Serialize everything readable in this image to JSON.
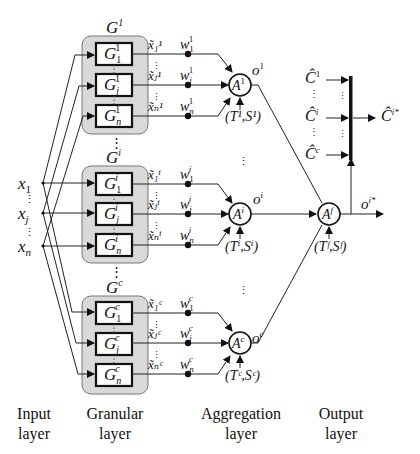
{
  "diagram": {
    "type": "granular neural network architecture",
    "inputs": [
      {
        "symbol": "x",
        "sub": "1"
      },
      {
        "symbol": "x",
        "sub": "j"
      },
      {
        "symbol": "x",
        "sub": "n"
      }
    ],
    "groups": [
      {
        "id": "1",
        "title": "G",
        "title_sup": "1",
        "granules": [
          {
            "sub": "1",
            "sup": "1"
          },
          {
            "sub": "j",
            "sup": "1"
          },
          {
            "sub": "n",
            "sup": "1"
          }
        ],
        "outputs": [
          "x̃₁¹",
          "x̃ⱼ¹",
          "x̃ₙ¹"
        ],
        "weights": [
          {
            "sub": "1",
            "sup": "1"
          },
          {
            "sub": "j",
            "sup": "1"
          },
          {
            "sub": "n",
            "sup": "1"
          }
        ],
        "aggregator": {
          "symbol": "A",
          "sup": "1"
        },
        "params": "(T¹,S¹)",
        "output": {
          "symbol": "o",
          "sup": "1"
        }
      },
      {
        "id": "i",
        "title": "G",
        "title_sup": "i",
        "granules": [
          {
            "sub": "1",
            "sup": "i"
          },
          {
            "sub": "j",
            "sup": "i"
          },
          {
            "sub": "n",
            "sup": "i"
          }
        ],
        "outputs": [
          "x̃₁ⁱ",
          "x̃ⱼⁱ",
          "x̃ₙⁱ"
        ],
        "weights": [
          {
            "sub": "1",
            "sup": "i"
          },
          {
            "sub": "j",
            "sup": "i"
          },
          {
            "sub": "n",
            "sup": "i"
          }
        ],
        "aggregator": {
          "symbol": "A",
          "sup": "i"
        },
        "params": "(Tⁱ,Sⁱ)",
        "output": {
          "symbol": "o",
          "sup": "i"
        }
      },
      {
        "id": "c",
        "title": "G",
        "title_sup": "c",
        "granules": [
          {
            "sub": "1",
            "sup": "c"
          },
          {
            "sub": "j",
            "sup": "c"
          },
          {
            "sub": "n",
            "sup": "c"
          }
        ],
        "outputs": [
          "x̃₁ᶜ",
          "x̃ⱼᶜ",
          "x̃ₙᶜ"
        ],
        "weights": [
          {
            "sub": "1",
            "sup": "c"
          },
          {
            "sub": "j",
            "sup": "c"
          },
          {
            "sub": "n",
            "sup": "c"
          }
        ],
        "aggregator": {
          "symbol": "A",
          "sup": "c"
        },
        "params": "(Tᶜ,Sᶜ)",
        "output": {
          "symbol": "o",
          "sup": "c"
        }
      }
    ],
    "final_aggregator": {
      "symbol": "A",
      "sup": "f",
      "params": "(Tᶠ,Sᶠ)"
    },
    "final_output": {
      "symbol": "o",
      "sup": "i*"
    },
    "class_labels": [
      {
        "symbol": "Ĉ",
        "sup": "1"
      },
      {
        "symbol": "Ĉ",
        "sup": "i"
      },
      {
        "symbol": "Ĉ",
        "sup": "c"
      }
    ],
    "selected_class": {
      "symbol": "Ĉ",
      "sup": "i*"
    },
    "vdots": "⋮",
    "layers": [
      {
        "line1": "Input",
        "line2": "layer"
      },
      {
        "line1": "Granular",
        "line2": "layer"
      },
      {
        "line1": "Aggregation",
        "line2": "layer"
      },
      {
        "line1": "Output",
        "line2": "layer"
      }
    ]
  }
}
